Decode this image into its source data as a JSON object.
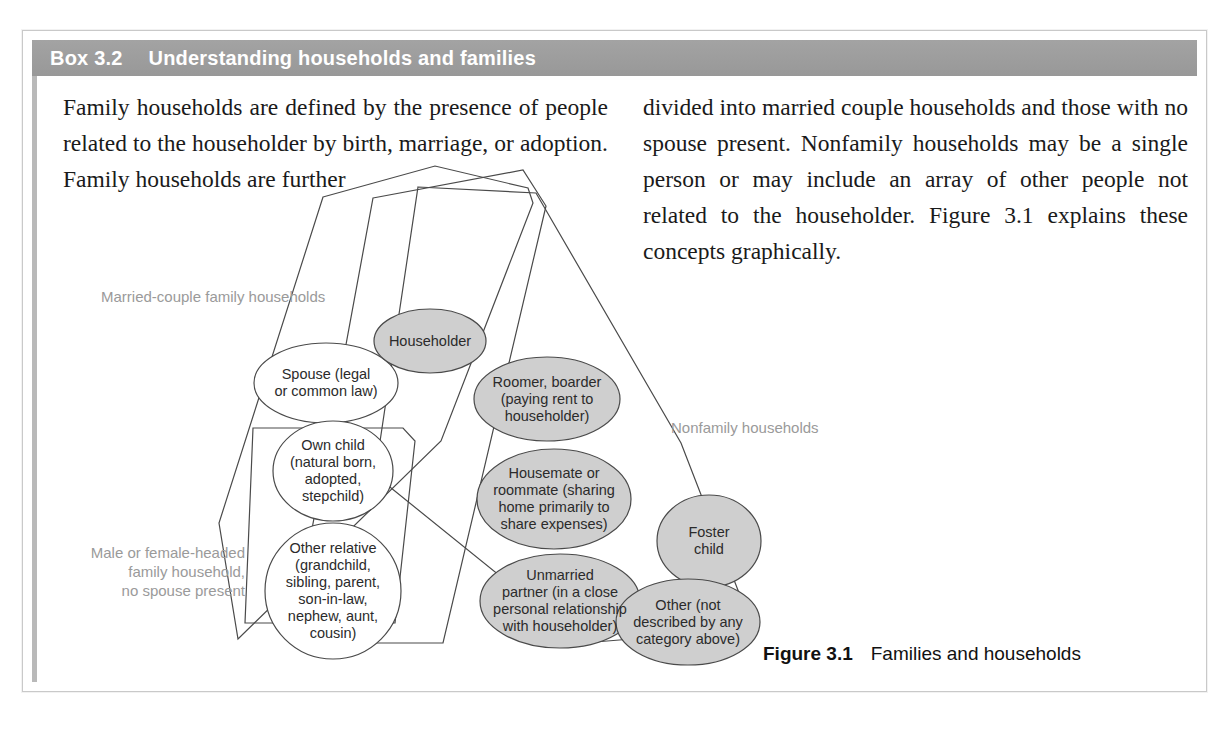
{
  "box": {
    "number": "Box 3.2",
    "title": "Understanding households and families",
    "header_color": "#9d9d9d"
  },
  "body": {
    "left_column": "Family households are defined by the presence of people related to the householder by birth, marriage, or adoption. Family households are further",
    "right_column": "divided into married couple households and those with no spouse present. Nonfamily households may be a single person or may include an array of other people not related to the householder. Figure 3.1 explains these concepts graphically."
  },
  "figure": {
    "caption_label": "Figure 3.1",
    "caption_text": "Families and households",
    "group_labels": {
      "married_couple": "Married-couple family households",
      "nonfamily": "Nonfamily households",
      "male_or_female_headed": "Male or female-headed\nfamily household,\nno spouse present"
    },
    "nodes": {
      "householder": "Householder",
      "spouse": "Spouse (legal\nor common law)",
      "own_child": "Own child\n(natural born,\nadopted,\nstepchild)",
      "other_relative": "Other relative\n(grandchild,\nsibling, parent,\nson-in-law,\nnephew, aunt,\ncousin)",
      "roomer_boarder": "Roomer, boarder\n(paying rent to\nhouseholder)",
      "housemate": "Housemate or\nroommate (sharing\nhome primarily to\nshare expenses)",
      "unmarried_partner": "Unmarried\npartner (in a close\npersonal relationship\nwith householder)",
      "foster_child": "Foster\nchild",
      "other": "Other (not\ndescribed by any\ncategory above)"
    },
    "colors": {
      "filled_node": "#cfcfcf",
      "open_node": "#ffffff",
      "outline": "#4a4a4a",
      "label_gray": "#9a9a9a"
    }
  }
}
